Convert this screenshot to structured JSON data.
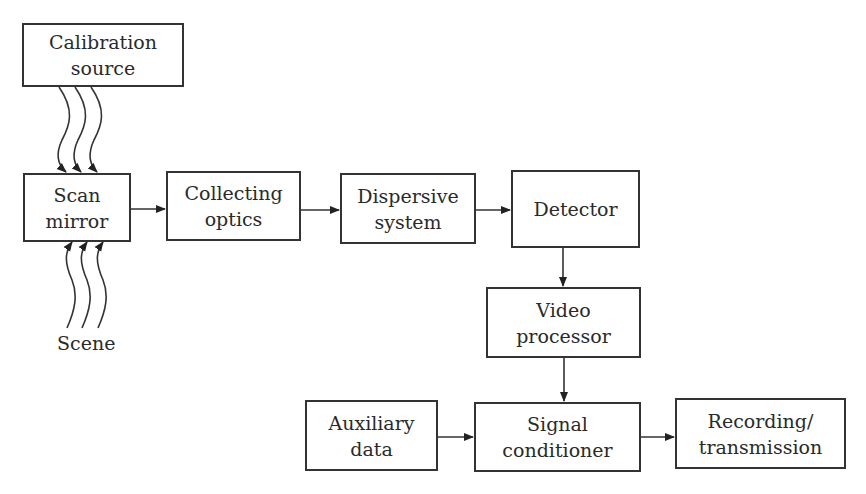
{
  "diagram": {
    "type": "block-diagram",
    "nodes": {
      "calibration_source": {
        "line1": "Calibration",
        "line2": "source"
      },
      "scan_mirror": {
        "line1": "Scan",
        "line2": "mirror"
      },
      "collecting_optics": {
        "line1": "Collecting",
        "line2": "optics"
      },
      "dispersive_system": {
        "line1": "Dispersive",
        "line2": "system"
      },
      "detector": {
        "line1": "Detector"
      },
      "video_processor": {
        "line1": "Video",
        "line2": "processor"
      },
      "auxiliary_data": {
        "line1": "Auxiliary",
        "line2": "data"
      },
      "signal_conditioner": {
        "line1": "Signal",
        "line2": "conditioner"
      },
      "recording_transmission": {
        "line1": "Recording/",
        "line2": "transmission"
      }
    },
    "scene_label": "Scene",
    "edges": [
      {
        "from": "Calibration source",
        "to": "Scan mirror",
        "style": "wavy x3"
      },
      {
        "from": "Scene",
        "to": "Scan mirror",
        "style": "wavy x3"
      },
      {
        "from": "Scan mirror",
        "to": "Collecting optics"
      },
      {
        "from": "Collecting optics",
        "to": "Dispersive system"
      },
      {
        "from": "Dispersive system",
        "to": "Detector"
      },
      {
        "from": "Detector",
        "to": "Video processor"
      },
      {
        "from": "Video processor",
        "to": "Signal conditioner"
      },
      {
        "from": "Auxiliary data",
        "to": "Signal conditioner"
      },
      {
        "from": "Signal conditioner",
        "to": "Recording/transmission"
      }
    ]
  }
}
